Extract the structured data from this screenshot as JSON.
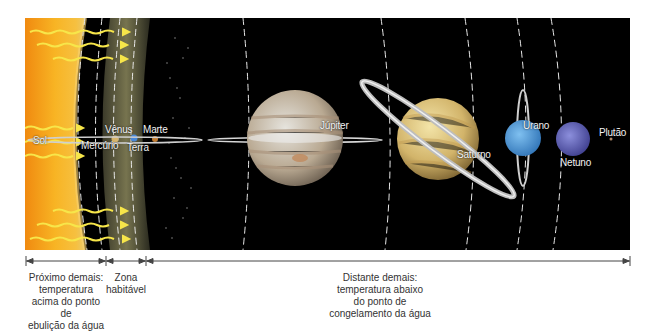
{
  "diagram": {
    "type": "solar-system-habitable-zone",
    "colors": {
      "space": "#000000",
      "sun": "#f6a81c",
      "habitable_zone": "#6b6a4a",
      "orbit_lines": "#e8e8e8",
      "heat_arrows": "#f7e64a",
      "caption_text": "#333333"
    },
    "bodies": [
      {
        "id": "sol",
        "label": "Sol"
      },
      {
        "id": "mercurio",
        "label": "Mercúrio"
      },
      {
        "id": "venus",
        "label": "Vênus"
      },
      {
        "id": "terra",
        "label": "Terra"
      },
      {
        "id": "marte",
        "label": "Marte"
      },
      {
        "id": "jupiter",
        "label": "Júpiter"
      },
      {
        "id": "saturno",
        "label": "Saturno"
      },
      {
        "id": "urano",
        "label": "Urano"
      },
      {
        "id": "netuno",
        "label": "Netuno"
      },
      {
        "id": "plutao",
        "label": "Plutão"
      }
    ],
    "zones": [
      {
        "id": "hot",
        "caption": [
          "Próximo demais:",
          "temperatura",
          "acima do ponto de",
          "ebulição da água"
        ]
      },
      {
        "id": "habitable",
        "caption": [
          "Zona",
          "habitável"
        ]
      },
      {
        "id": "cold",
        "caption": [
          "Distante demais:",
          "temperatura abaixo",
          "do ponto de",
          "congelamento da água"
        ]
      }
    ]
  }
}
